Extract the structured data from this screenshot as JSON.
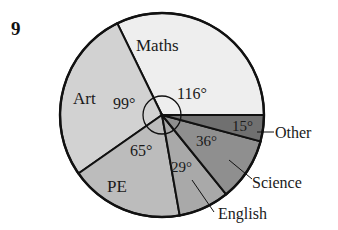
{
  "question_number": "9",
  "chart_data": {
    "type": "pie",
    "title": "",
    "unit": "degrees",
    "categories": [
      "Maths",
      "Art",
      "PE",
      "English",
      "Science",
      "Other"
    ],
    "values": [
      116,
      99,
      65,
      29,
      36,
      15
    ],
    "value_labels": [
      "116°",
      "99°",
      "65°",
      "29°",
      "36°",
      "15°"
    ],
    "colors": [
      "#eeeeee",
      "#d2d2d2",
      "#bcbcbc",
      "#a9a9a9",
      "#8f8f8f",
      "#707070"
    ],
    "total": 360,
    "center_angle_marker": true
  }
}
